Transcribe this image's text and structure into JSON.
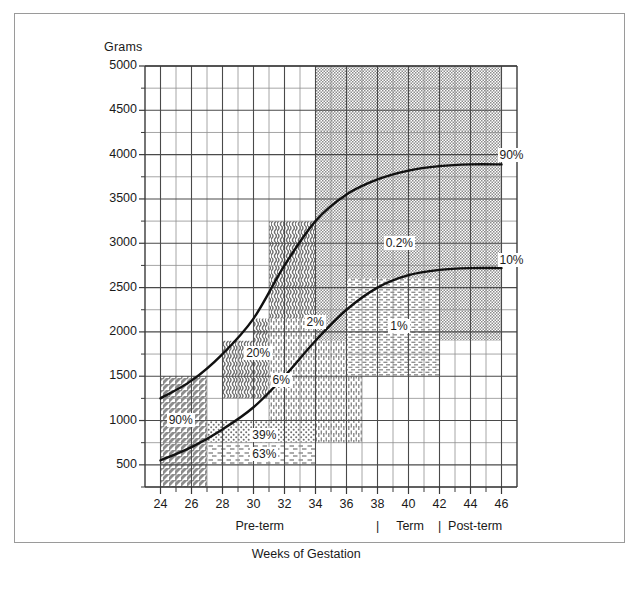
{
  "figure": {
    "background": "#ffffff",
    "frame_color": "#9a9a9a",
    "axis_color": "#3a3a3a",
    "curve_color": "#111111"
  },
  "chart_data": {
    "type": "line",
    "title": "",
    "xlabel": "Weeks of Gestation",
    "ylabel": "Grams",
    "xlim": [
      23,
      47
    ],
    "ylim": [
      250,
      5000
    ],
    "grid": true,
    "legend_position": "none",
    "x_ticks": [
      24,
      26,
      28,
      30,
      32,
      34,
      36,
      38,
      40,
      42,
      44,
      46
    ],
    "x_tick_labels": [
      "24",
      "26",
      "28",
      "30",
      "32",
      "34",
      "36",
      "38",
      "40",
      "42",
      "44",
      "46"
    ],
    "y_ticks": [
      500,
      1000,
      1500,
      2000,
      2500,
      3000,
      3500,
      4000,
      4500,
      5000
    ],
    "y_tick_labels": [
      "500",
      "1000",
      "1500",
      "2000",
      "2500",
      "3000",
      "3500",
      "4000",
      "4500",
      "5000"
    ],
    "y_minor_step": 250,
    "x_minor_step": 1,
    "series": [
      {
        "name": "90%",
        "label": "90%",
        "x": [
          24,
          26,
          28,
          30,
          32,
          34,
          36,
          38,
          40,
          42,
          44,
          46
        ],
        "y": [
          1250,
          1450,
          1750,
          2150,
          2750,
          3250,
          3550,
          3720,
          3820,
          3870,
          3890,
          3890
        ]
      },
      {
        "name": "10%",
        "label": "10%",
        "x": [
          24,
          26,
          28,
          30,
          32,
          34,
          36,
          38,
          40,
          42,
          44,
          46
        ],
        "y": [
          550,
          700,
          900,
          1150,
          1500,
          1900,
          2250,
          2500,
          2640,
          2700,
          2720,
          2720
        ]
      }
    ],
    "region_labels": [
      {
        "text": "90%",
        "x": 25.3,
        "y": 1000
      },
      {
        "text": "20%",
        "x": 30.3,
        "y": 1750
      },
      {
        "text": "6%",
        "x": 32.0,
        "y": 1450
      },
      {
        "text": "2%",
        "x": 34.2,
        "y": 2100
      },
      {
        "text": "1%",
        "x": 39.6,
        "y": 2050
      },
      {
        "text": "0.2%",
        "x": 39.3,
        "y": 2990
      },
      {
        "text": "39%",
        "x": 30.7,
        "y": 820
      },
      {
        "text": "63%",
        "x": 30.7,
        "y": 610
      }
    ],
    "curve_end_labels": [
      {
        "text": "90%",
        "x": 46.0,
        "y": 3980
      },
      {
        "text": "10%",
        "x": 46.0,
        "y": 2800
      }
    ],
    "shaded_regions": [
      {
        "name": "90%-diagonal-hatch",
        "pattern": "diagonal-hatch",
        "x0": 24,
        "x1": 27,
        "y0": 250,
        "y1": 1500
      },
      {
        "name": "20%-wavy",
        "pattern": "wavy",
        "x0": 28,
        "x1": 31,
        "y0": 1250,
        "y1": 1900
      },
      {
        "name": "20%-wavy-upper",
        "pattern": "wavy",
        "x0": 30,
        "x1": 32,
        "y0": 1250,
        "y1": 2150
      },
      {
        "name": "20%-wavy-top",
        "pattern": "wavy",
        "x0": 31,
        "x1": 34,
        "y0": 1250,
        "y1": 3250
      },
      {
        "name": "6%-vertical-dash",
        "pattern": "vertical-dash",
        "x0": 31,
        "x1": 37,
        "y0": 750,
        "y1": 2150
      },
      {
        "name": "2%-gray-dot",
        "pattern": "gray-dot",
        "x0": 34,
        "x1": 46,
        "y0": 1900,
        "y1": 5000
      },
      {
        "name": "0.2%-gray-dot-low",
        "pattern": "gray-dot",
        "x0": 34,
        "x1": 46,
        "y0": 2900,
        "y1": 3200
      },
      {
        "name": "1%-horiz-dash",
        "pattern": "horizontal-dash",
        "x0": 36,
        "x1": 42,
        "y0": 1500,
        "y1": 2600
      },
      {
        "name": "39%-dotted",
        "pattern": "dotted",
        "x0": 27,
        "x1": 34,
        "y0": 750,
        "y1": 1000
      },
      {
        "name": "63%-dashed",
        "pattern": "dashed",
        "x0": 27,
        "x1": 34,
        "y0": 500,
        "y1": 750
      }
    ]
  },
  "axis": {
    "y_title": "Grams",
    "x_title": "Weeks of Gestation",
    "x_sublabels": [
      {
        "text": "Pre-term",
        "x": 30.4
      },
      {
        "text": "Term",
        "x": 40.1
      },
      {
        "text": "Post-term",
        "x": 44.3
      }
    ],
    "x_subdividers": [
      {
        "text": "|",
        "x": 38.0
      },
      {
        "text": "|",
        "x": 42.0
      }
    ]
  }
}
